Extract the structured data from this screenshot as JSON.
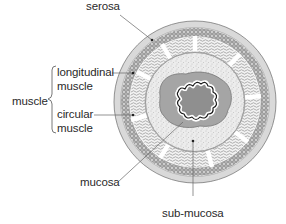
{
  "diagram": {
    "type": "cross-section",
    "labels": {
      "serosa": "serosa",
      "longitudinal_muscle_line1": "longitudinal",
      "longitudinal_muscle_line2": "muscle",
      "muscle_group": "muscle",
      "circular_muscle_line1": "circular",
      "circular_muscle_line2": "muscle",
      "mucosa": "mucosa",
      "sub_mucosa": "sub-mucosa"
    },
    "layers_outer_to_inner": [
      "serosa",
      "longitudinal muscle",
      "circular muscle",
      "sub-mucosa",
      "mucosa",
      "lumen"
    ],
    "colors": {
      "serosa": "#d9d9d9",
      "muscle_band": "#b5b5b5",
      "submucosa": "#e6e6e6",
      "mucosa": "#9e9e9e",
      "lumen": "#8f8f8f",
      "outline": "#555555",
      "leader": "#666666",
      "text": "#2a2a2a"
    }
  }
}
